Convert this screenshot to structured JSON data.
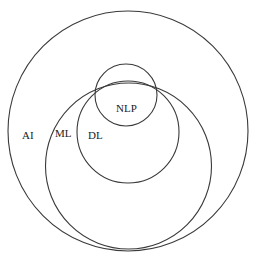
{
  "diagram": {
    "type": "nested-venn",
    "stroke_color": "#3a3a3a",
    "circles": [
      {
        "id": "ai",
        "label": "AI",
        "cx": 128,
        "cy": 131,
        "r": 120,
        "label_x": 22,
        "label_y": 139
      },
      {
        "id": "ml",
        "label": "ML",
        "cx": 128.5,
        "cy": 166,
        "r": 83,
        "label_x": 55,
        "label_y": 137
      },
      {
        "id": "dl",
        "label": "DL",
        "cx": 128,
        "cy": 132,
        "r": 51,
        "label_x": 88,
        "label_y": 139
      },
      {
        "id": "nlp",
        "label": "NLP",
        "cx": 126,
        "cy": 95,
        "r": 31,
        "label_x": 116,
        "label_y": 112
      }
    ]
  }
}
